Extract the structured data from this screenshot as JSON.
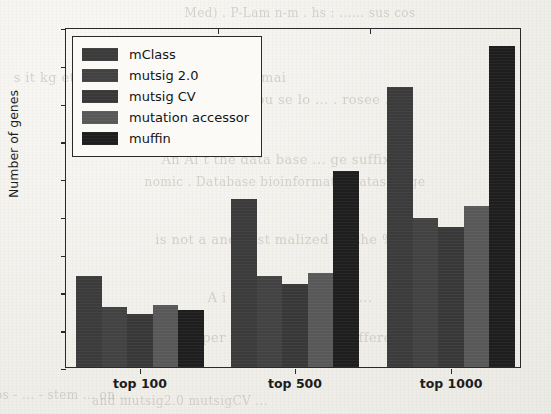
{
  "ghost_text": [
    {
      "text": "Med)  .  P-Lam  n-m  .  hs  :  ......  sus  cos",
      "x": 300,
      "y": 6,
      "size": 12
    },
    {
      "text": "s  it  kg  et  al .  Mal  t  a  a  sp  et  al  ti  in  mai",
      "x": 150,
      "y": 70,
      "size": 13
    },
    {
      "text": "m  Nam  pu  se  lo  ...  .  rosee  ...",
      "x": 300,
      "y": 92,
      "size": 13
    },
    {
      "text": "An  Al  t  the  data  base  ...  ge  suffix  ...",
      "x": 285,
      "y": 152,
      "size": 13
    },
    {
      "text": "nomic  .  Database  bioinformatic  datasets  ge",
      "x": 285,
      "y": 175,
      "size": 12
    },
    {
      "text": "is  not  a  and  Test  malized  on  the  %",
      "x": 275,
      "y": 232,
      "size": 13
    },
    {
      "text": "A  i  e  t  o  at  sucr  e  ers  ...",
      "x": 290,
      "y": 290,
      "size": 13
    },
    {
      "text": "Munan  exper  informative  and  different",
      "x": 270,
      "y": 330,
      "size": 13
    },
    {
      "text": "cos  -  ...  -  stem  ...  on  ...",
      "x": 60,
      "y": 388,
      "size": 12
    },
    {
      "text": "and  mutsig2.0  mutsigCV  ...",
      "x": 180,
      "y": 394,
      "size": 12
    }
  ],
  "chart_data": {
    "type": "bar",
    "title": "",
    "xlabel": "",
    "ylabel": "Number of genes",
    "ylim": [
      0,
      90
    ],
    "yticks": [
      0,
      10,
      20,
      30,
      40,
      50,
      60,
      70,
      80,
      90
    ],
    "grid": false,
    "legend_position": "upper left",
    "categories": [
      "top 100",
      "top 500",
      "top 1000"
    ],
    "series": [
      {
        "name": "mClass",
        "color": "#3b3b3b",
        "values": [
          24,
          44.5,
          74
        ]
      },
      {
        "name": "mutsig 2.0",
        "color": "#424242",
        "values": [
          16,
          24,
          39.5
        ]
      },
      {
        "name": "mutsig CV",
        "color": "#383838",
        "values": [
          14,
          22,
          37
        ]
      },
      {
        "name": "mutation accessor",
        "color": "#585858",
        "values": [
          16.5,
          25,
          42.5
        ]
      },
      {
        "name": "muffin",
        "color": "#1e1e1e",
        "values": [
          15,
          52,
          85
        ]
      }
    ]
  }
}
